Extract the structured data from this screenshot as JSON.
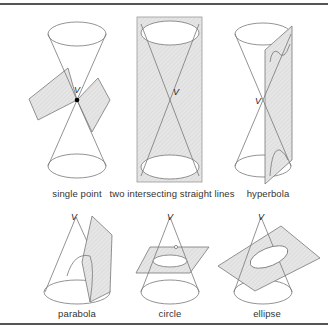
{
  "figure": {
    "vertex_label": "V",
    "colors": {
      "line": "#777777",
      "plane_fill": "#e2e2e2",
      "rule": "#555555",
      "text": "#333333"
    },
    "panels": [
      {
        "id": "single-point",
        "caption": "single point"
      },
      {
        "id": "two-lines",
        "caption": "two intersecting straight lines"
      },
      {
        "id": "hyperbola",
        "caption": "hyperbola"
      },
      {
        "id": "parabola",
        "caption": "parabola"
      },
      {
        "id": "circle",
        "caption": "circle"
      },
      {
        "id": "ellipse",
        "caption": "ellipse"
      }
    ]
  }
}
